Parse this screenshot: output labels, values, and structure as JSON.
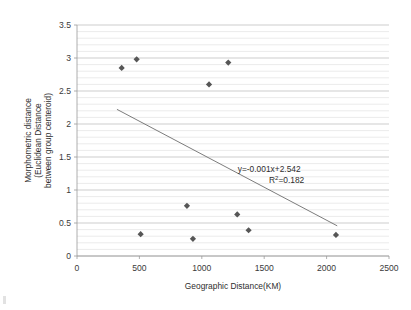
{
  "chart_data": {
    "type": "scatter",
    "title": "",
    "xlabel": "Geographic Distance(KM)",
    "ylabel": "Morphometric distance (Euclidean Distance between group centeroid)",
    "ylabel_lines": [
      "Morphometric distance",
      "(Euclidean Distance",
      "between group centeroid)"
    ],
    "xlim": [
      0,
      2500
    ],
    "ylim": [
      0,
      3.5
    ],
    "xticks": [
      0,
      500,
      1000,
      1500,
      2000,
      2500
    ],
    "xtick_labels": [
      "0",
      "500",
      "1000",
      "1500",
      "2000",
      "2500"
    ],
    "yticks": [
      0,
      0.5,
      1,
      1.5,
      2,
      2.5,
      3,
      3.5
    ],
    "ytick_labels": [
      "0",
      "0.5",
      "1",
      "1.5",
      "2",
      "2.5",
      "3",
      "3.5"
    ],
    "grid": true,
    "grid_minor_step": 0.1,
    "grid_major_step": 0.5,
    "legend": false,
    "marker_shape": "diamond",
    "marker_color": "#565656",
    "trendline_color": "#6d6d6d",
    "points": [
      {
        "x": 358,
        "y": 2.85
      },
      {
        "x": 478,
        "y": 2.98
      },
      {
        "x": 1058,
        "y": 2.6
      },
      {
        "x": 1212,
        "y": 2.93
      },
      {
        "x": 510,
        "y": 0.33
      },
      {
        "x": 881,
        "y": 0.76
      },
      {
        "x": 929,
        "y": 0.26
      },
      {
        "x": 1284,
        "y": 0.63
      },
      {
        "x": 1375,
        "y": 0.39
      },
      {
        "x": 2075,
        "y": 0.32
      }
    ],
    "trendline": {
      "slope": -0.001,
      "intercept": 2.542,
      "x_start": 320,
      "x_end": 2085
    },
    "annotations": [
      {
        "text": "y=-0.001x+2.542",
        "x": 1540,
        "y": 1.28
      },
      {
        "text": "R²=0.182",
        "x": 1680,
        "y": 1.1
      }
    ],
    "equation_label": "y=-0.001x+2.542",
    "r_squared_prefix": "R",
    "r_squared_sup": "2",
    "r_squared_value": "=0.182"
  }
}
